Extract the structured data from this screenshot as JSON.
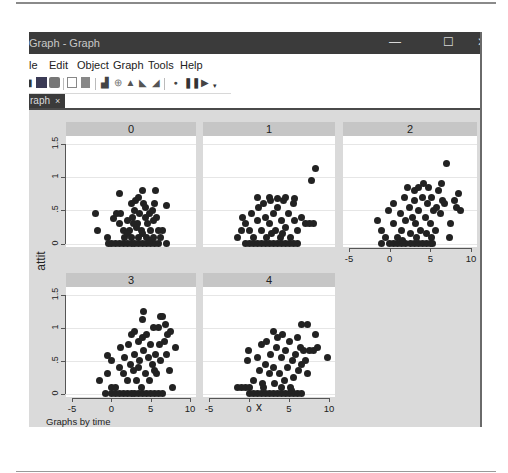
{
  "window": {
    "title": "Graph - Graph",
    "controls": {
      "minimize": "—",
      "maximize": "☐",
      "close": "✕"
    }
  },
  "menubar": [
    "le",
    "Edit",
    "Object",
    "Graph",
    "Tools",
    "Help"
  ],
  "toolbar": {
    "icons": [
      "open-icon",
      "save-icon",
      "print-icon",
      "copy-icon",
      "paste-icon",
      "graph-editor-icon",
      "properties-icon",
      "pointer-icon",
      "add-text-icon",
      "add-line-icon",
      "record-icon",
      "pause-icon",
      "play-icon",
      "dropdown-icon"
    ]
  },
  "tabs": [
    {
      "label": "raph",
      "close": "×"
    }
  ],
  "graph": {
    "y_title": "attit",
    "x_title": "x",
    "note": "Graphs by time",
    "background": "#dadada",
    "header_color": "#c6c6c6",
    "marker_color": "#222222"
  },
  "chart_data": {
    "type": "scatter",
    "title": "",
    "xlabel": "x",
    "ylabel": "attit",
    "note": "Graphs by time",
    "by_variable": "time",
    "xlim": [
      -5,
      10
    ],
    "ylim": [
      0,
      1.5
    ],
    "x_ticks": [
      "-5",
      "0",
      "5",
      "10"
    ],
    "y_ticks": [
      "0",
      ".5",
      "1",
      "1.5"
    ],
    "grid": true,
    "panels": [
      {
        "label": "0",
        "points": [
          [
            -2,
            0.45
          ],
          [
            -1.7,
            0.2
          ],
          [
            -0.5,
            0.1
          ],
          [
            -0.3,
            0
          ],
          [
            0,
            0
          ],
          [
            0.5,
            0
          ],
          [
            1,
            0
          ],
          [
            1.5,
            0
          ],
          [
            2,
            0
          ],
          [
            2.5,
            0
          ],
          [
            3,
            0
          ],
          [
            3.5,
            0
          ],
          [
            4,
            0
          ],
          [
            4.5,
            0
          ],
          [
            5,
            0
          ],
          [
            5.5,
            0
          ],
          [
            6,
            0
          ],
          [
            7,
            0
          ],
          [
            0.3,
            0.38
          ],
          [
            0.6,
            0.45
          ],
          [
            1,
            0.3
          ],
          [
            1.2,
            0.45
          ],
          [
            1.5,
            0.2
          ],
          [
            1.7,
            0.1
          ],
          [
            2,
            0.35
          ],
          [
            2.3,
            0.2
          ],
          [
            2.5,
            0.1
          ],
          [
            2.7,
            0.4
          ],
          [
            3,
            0.5
          ],
          [
            3.1,
            0.65
          ],
          [
            3.3,
            0.3
          ],
          [
            3.5,
            0.7
          ],
          [
            3.6,
            0.45
          ],
          [
            3.8,
            0.2
          ],
          [
            4,
            0.8
          ],
          [
            4.1,
            0.6
          ],
          [
            4.3,
            0.4
          ],
          [
            4.5,
            0.1
          ],
          [
            4.6,
            0.3
          ],
          [
            4.8,
            0.45
          ],
          [
            5,
            0.2
          ],
          [
            5.2,
            0.5
          ],
          [
            5.4,
            0.35
          ],
          [
            5.5,
            0.6
          ],
          [
            5.6,
            0.8
          ],
          [
            5.8,
            0.4
          ],
          [
            6,
            0.2
          ],
          [
            6.2,
            0.1
          ],
          [
            6.5,
            0.2
          ],
          [
            7,
            0.58
          ],
          [
            1,
            0.75
          ],
          [
            2.6,
            0.6
          ],
          [
            3.2,
            0.25
          ],
          [
            3.9,
            0.15
          ],
          [
            4.4,
            0.55
          ],
          [
            5.3,
            0.1
          ],
          [
            2.1,
            0.15
          ],
          [
            4.9,
            0.05
          ],
          [
            3.4,
            0.1
          ],
          [
            2.8,
            0.3
          ]
        ]
      },
      {
        "label": "1",
        "points": [
          [
            -1.5,
            0.1
          ],
          [
            -1,
            0.2
          ],
          [
            -0.5,
            0
          ],
          [
            0,
            0
          ],
          [
            0.5,
            0
          ],
          [
            1,
            0
          ],
          [
            1.5,
            0
          ],
          [
            2,
            0
          ],
          [
            2.5,
            0
          ],
          [
            3,
            0
          ],
          [
            3.5,
            0
          ],
          [
            4,
            0
          ],
          [
            4.5,
            0
          ],
          [
            5,
            0
          ],
          [
            5.5,
            0
          ],
          [
            6,
            0
          ],
          [
            -0.8,
            0.4
          ],
          [
            -0.5,
            0.3
          ],
          [
            0,
            0.2
          ],
          [
            0.3,
            0.45
          ],
          [
            0.6,
            0.1
          ],
          [
            1,
            0.35
          ],
          [
            1.2,
            0.55
          ],
          [
            1.5,
            0.2
          ],
          [
            1.8,
            0.6
          ],
          [
            2,
            0.4
          ],
          [
            2.2,
            0.1
          ],
          [
            2.5,
            0.3
          ],
          [
            2.7,
            0.65
          ],
          [
            3,
            0.45
          ],
          [
            3.3,
            0.2
          ],
          [
            3.6,
            0.55
          ],
          [
            3.9,
            0.1
          ],
          [
            4,
            0.35
          ],
          [
            4.3,
            0.65
          ],
          [
            4.6,
            0.25
          ],
          [
            4.9,
            0.45
          ],
          [
            5.2,
            0.1
          ],
          [
            5.5,
            0.6
          ],
          [
            5.7,
            0.35
          ],
          [
            6,
            0.2
          ],
          [
            6.5,
            0.4
          ],
          [
            7,
            0.3
          ],
          [
            7.5,
            0.3
          ],
          [
            8,
            0.3
          ],
          [
            7.8,
            0.95
          ],
          [
            8.3,
            1.13
          ],
          [
            1,
            0.7
          ],
          [
            2.5,
            0.7
          ],
          [
            3.5,
            0.68
          ],
          [
            4.5,
            0.7
          ],
          [
            5.7,
            0.68
          ],
          [
            2.8,
            0.15
          ],
          [
            4.2,
            0.15
          ]
        ]
      },
      {
        "label": "2",
        "points": [
          [
            -1.5,
            0.35
          ],
          [
            -1,
            0
          ],
          [
            -0.5,
            0.1
          ],
          [
            0,
            0
          ],
          [
            0.5,
            0
          ],
          [
            1,
            0
          ],
          [
            1.5,
            0
          ],
          [
            2,
            0
          ],
          [
            2.5,
            0
          ],
          [
            3,
            0
          ],
          [
            3.5,
            0
          ],
          [
            4,
            0
          ],
          [
            4.5,
            0
          ],
          [
            5,
            0
          ],
          [
            5.3,
            0
          ],
          [
            -1,
            0.2
          ],
          [
            -0.2,
            0.5
          ],
          [
            0.5,
            0.3
          ],
          [
            0.5,
            0.6
          ],
          [
            1,
            0.1
          ],
          [
            1.3,
            0.45
          ],
          [
            1.5,
            0.2
          ],
          [
            1.8,
            0.7
          ],
          [
            2,
            0.35
          ],
          [
            2.2,
            0.85
          ],
          [
            2.4,
            0.55
          ],
          [
            2.6,
            0.15
          ],
          [
            2.8,
            0.4
          ],
          [
            3,
            0.8
          ],
          [
            3,
            0.65
          ],
          [
            3.2,
            0.3
          ],
          [
            3.5,
            0.85
          ],
          [
            3.6,
            0.5
          ],
          [
            3.8,
            0.2
          ],
          [
            4,
            0.7
          ],
          [
            4.2,
            0.9
          ],
          [
            4.4,
            0.4
          ],
          [
            4.6,
            0.6
          ],
          [
            4.8,
            0.85
          ],
          [
            5,
            0.3
          ],
          [
            5.1,
            0.1
          ],
          [
            5.2,
            0.7
          ],
          [
            5.4,
            0.5
          ],
          [
            5.6,
            0.2
          ],
          [
            5.8,
            0.55
          ],
          [
            6,
            0.8
          ],
          [
            6.2,
            0.45
          ],
          [
            6.4,
            0.9
          ],
          [
            6.5,
            0.65
          ],
          [
            6.8,
            0.6
          ],
          [
            7,
            1.2
          ],
          [
            7.3,
            0.1
          ],
          [
            7.5,
            0.3
          ],
          [
            8,
            0.65
          ],
          [
            8.2,
            0.55
          ],
          [
            8.5,
            0.75
          ],
          [
            8.7,
            0.5
          ],
          [
            1.6,
            0.05
          ],
          [
            3.3,
            0.1
          ],
          [
            4.5,
            0.15
          ]
        ]
      },
      {
        "label": "3",
        "points": [
          [
            -1.5,
            0.2
          ],
          [
            -0.7,
            0
          ],
          [
            -0.5,
            0.3
          ],
          [
            0,
            0.1
          ],
          [
            0,
            0
          ],
          [
            0.5,
            0
          ],
          [
            1,
            0
          ],
          [
            1.5,
            0
          ],
          [
            2,
            0
          ],
          [
            2.5,
            0
          ],
          [
            3,
            0
          ],
          [
            3.5,
            0
          ],
          [
            4,
            0
          ],
          [
            4.5,
            0
          ],
          [
            5,
            0
          ],
          [
            5.5,
            0
          ],
          [
            6,
            0
          ],
          [
            6.5,
            0
          ],
          [
            -0.5,
            0.58
          ],
          [
            0,
            0.5
          ],
          [
            0.5,
            0.1
          ],
          [
            1,
            0.4
          ],
          [
            1.2,
            0.7
          ],
          [
            1.5,
            0.3
          ],
          [
            1.7,
            0.55
          ],
          [
            2,
            0.2
          ],
          [
            2.2,
            0.75
          ],
          [
            2.4,
            0.45
          ],
          [
            2.6,
            0.9
          ],
          [
            2.8,
            0.35
          ],
          [
            3,
            0.95
          ],
          [
            3,
            0.6
          ],
          [
            3.2,
            0.2
          ],
          [
            3.4,
            0.8
          ],
          [
            3.6,
            0.5
          ],
          [
            3.8,
            0.1
          ],
          [
            4,
            0.85
          ],
          [
            4.1,
            0.65
          ],
          [
            4.3,
            0.3
          ],
          [
            4.5,
            0.9
          ],
          [
            4.7,
            0.55
          ],
          [
            4.9,
            0.2
          ],
          [
            5,
            0.75
          ],
          [
            5.2,
            0.45
          ],
          [
            5.4,
            1
          ],
          [
            5.6,
            0.6
          ],
          [
            5.8,
            0.3
          ],
          [
            6,
            1
          ],
          [
            6.1,
            0.75
          ],
          [
            6.3,
            0.5
          ],
          [
            6.5,
            1.17
          ],
          [
            6.7,
            0.8
          ],
          [
            6.9,
            1.05
          ],
          [
            7,
            0.6
          ],
          [
            7.2,
            0.9
          ],
          [
            7.4,
            0.35
          ],
          [
            7.8,
            0.1
          ],
          [
            8.2,
            0.7
          ],
          [
            4.1,
            1.25
          ],
          [
            3.9,
            1.12
          ],
          [
            6.3,
            1.17
          ],
          [
            7.5,
            0.95
          ],
          [
            3.5,
            0.4
          ],
          [
            5.5,
            0.35
          ]
        ]
      },
      {
        "label": "4",
        "points": [
          [
            -1.5,
            0.1
          ],
          [
            -1,
            0.1
          ],
          [
            -0.5,
            0.1
          ],
          [
            0,
            0
          ],
          [
            0,
            0.1
          ],
          [
            0.5,
            0
          ],
          [
            1,
            0
          ],
          [
            1.5,
            0
          ],
          [
            2,
            0
          ],
          [
            2.5,
            0
          ],
          [
            3,
            0
          ],
          [
            3.5,
            0
          ],
          [
            4,
            0
          ],
          [
            4.5,
            0
          ],
          [
            5,
            0
          ],
          [
            5.5,
            0
          ],
          [
            6,
            0
          ],
          [
            6.5,
            0
          ],
          [
            -0.2,
            0.5
          ],
          [
            -0.1,
            0.65
          ],
          [
            0.5,
            0.2
          ],
          [
            1,
            0.55
          ],
          [
            1.3,
            0.35
          ],
          [
            1.5,
            0.75
          ],
          [
            1.7,
            0.15
          ],
          [
            2,
            0.45
          ],
          [
            2.2,
            0.8
          ],
          [
            2.5,
            0.3
          ],
          [
            2.7,
            0.6
          ],
          [
            3,
            0.95
          ],
          [
            3,
            0.4
          ],
          [
            3.2,
            0.15
          ],
          [
            3.4,
            0.7
          ],
          [
            3.6,
            0.85
          ],
          [
            3.8,
            0.3
          ],
          [
            4,
            0.55
          ],
          [
            4.2,
            0.9
          ],
          [
            4.4,
            0.2
          ],
          [
            4.6,
            0.65
          ],
          [
            4.8,
            0.4
          ],
          [
            5,
            0.8
          ],
          [
            5.2,
            0.1
          ],
          [
            5.4,
            0.5
          ],
          [
            5.6,
            0.25
          ],
          [
            5.8,
            0.6
          ],
          [
            6,
            0.85
          ],
          [
            6.2,
            0.35
          ],
          [
            6.4,
            0.7
          ],
          [
            6.6,
            0.45
          ],
          [
            6.8,
            0.65
          ],
          [
            7,
            0.5
          ],
          [
            7.3,
            0.3
          ],
          [
            7.6,
            0.65
          ],
          [
            8,
            0.65
          ],
          [
            8.3,
            0.9
          ],
          [
            8.6,
            0.7
          ],
          [
            9.8,
            0.55
          ],
          [
            6.5,
            1.05
          ],
          [
            7.3,
            1.05
          ],
          [
            1.8,
            0.1
          ],
          [
            4.1,
            0.1
          ],
          [
            5.3,
            0.05
          ]
        ]
      }
    ]
  }
}
